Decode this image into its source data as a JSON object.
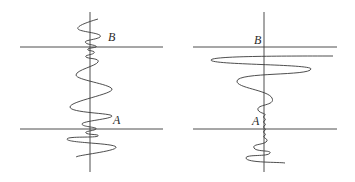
{
  "figure": {
    "panels": [
      {
        "id": "left",
        "description": "Wave packet with dense oscillations near boundary lines",
        "labels": {
          "upper": "B",
          "lower": "A"
        }
      },
      {
        "id": "right",
        "description": "Wave with large excursion below upper boundary and dense oscillations near lower boundary",
        "labels": {
          "upper": "B",
          "lower": "A"
        }
      }
    ]
  }
}
